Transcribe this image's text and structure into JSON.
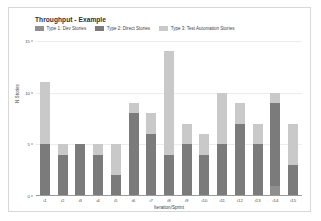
{
  "chart_data": {
    "type": "bar",
    "title": "Throughput - Example",
    "xlabel": "Iteration/Sprint",
    "ylabel": "N Stories",
    "stacked": true,
    "grid": true,
    "legend_position": "top-left",
    "ylim": [
      0,
      15
    ],
    "yticks": [
      0,
      5,
      10,
      15
    ],
    "categories": [
      "i1",
      "i2",
      "i3",
      "i4",
      "i5",
      "i6",
      "i7",
      "i8",
      "i9",
      "i10",
      "i11",
      "i12",
      "i13",
      "i14",
      "i15"
    ],
    "series": [
      {
        "name": "Type 1: Dev Stories",
        "color": "#8f8f8f",
        "values": [
          0,
          0,
          0,
          0,
          0,
          0,
          0,
          0,
          0,
          0,
          0,
          0,
          0,
          1,
          0
        ]
      },
      {
        "name": "Type 2: Direct Stories",
        "color": "#7b7b7b",
        "values": [
          5,
          4,
          5,
          4,
          2,
          8,
          6,
          4,
          5,
          4,
          5,
          7,
          5,
          8,
          3
        ]
      },
      {
        "name": "Type 3: Test Automation Stories",
        "color": "#c9c9c9",
        "values": [
          6,
          1,
          0,
          1,
          3,
          1,
          2,
          10,
          2,
          2,
          5,
          2,
          2,
          1,
          4
        ]
      }
    ],
    "totals": [
      11,
      5,
      5,
      5,
      5,
      9,
      8,
      14,
      7,
      6,
      10,
      9,
      9,
      10,
      7
    ]
  },
  "legend": {
    "items": [
      {
        "label": "Type 1: Dev Stories",
        "color": "#8f8f8f"
      },
      {
        "label": "Type 2: Direct Stories",
        "color": "#7b7b7b"
      },
      {
        "label": "Type 3: Test Automation Stories",
        "color": "#c9c9c9"
      }
    ]
  }
}
